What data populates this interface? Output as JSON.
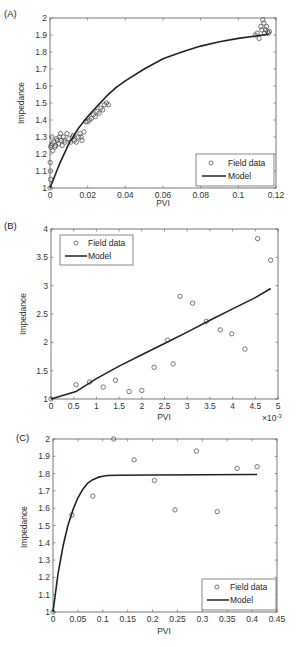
{
  "chart_data": [
    {
      "panel": "(A)",
      "type": "scatter",
      "title": "",
      "xlabel": "PVI",
      "ylabel": "Impedance",
      "xlim": [
        0,
        0.12
      ],
      "ylim": [
        1,
        2
      ],
      "xticks": [
        0,
        0.02,
        0.04,
        0.06,
        0.08,
        0.1,
        0.12
      ],
      "xtick_labels": [
        "0",
        "0.02",
        "0.04",
        "0.06",
        "0.08",
        "0.1",
        "0.12"
      ],
      "yticks": [
        1,
        1.1,
        1.2,
        1.3,
        1.4,
        1.5,
        1.6,
        1.7,
        1.8,
        1.9,
        2
      ],
      "ytick_labels": [
        "1",
        "1.1",
        "1.2",
        "1.3",
        "1.4",
        "1.5",
        "1.6",
        "1.7",
        "1.8",
        "1.9",
        "2"
      ],
      "grid": false,
      "legend_position": "lower right",
      "legend": [
        "Field data",
        "Model"
      ],
      "series": [
        {
          "name": "Field data",
          "style": "marker-circle",
          "points": [
            [
              0.0,
              1.0
            ],
            [
              0.0003,
              1.05
            ],
            [
              0.0002,
              1.1
            ],
            [
              0.0001,
              1.15
            ],
            [
              0.0004,
              1.24
            ],
            [
              0.0006,
              1.25
            ],
            [
              0.001,
              1.3
            ],
            [
              0.0012,
              1.26
            ],
            [
              0.0015,
              1.22
            ],
            [
              0.002,
              1.27
            ],
            [
              0.0025,
              1.24
            ],
            [
              0.003,
              1.25
            ],
            [
              0.0035,
              1.29
            ],
            [
              0.004,
              1.28
            ],
            [
              0.0045,
              1.26
            ],
            [
              0.005,
              1.3
            ],
            [
              0.0055,
              1.32
            ],
            [
              0.006,
              1.28
            ],
            [
              0.0065,
              1.25
            ],
            [
              0.007,
              1.3
            ],
            [
              0.0075,
              1.28
            ],
            [
              0.008,
              1.27
            ],
            [
              0.009,
              1.32
            ],
            [
              0.01,
              1.29
            ],
            [
              0.011,
              1.27
            ],
            [
              0.012,
              1.3
            ],
            [
              0.0125,
              1.31
            ],
            [
              0.013,
              1.28
            ],
            [
              0.014,
              1.27
            ],
            [
              0.015,
              1.3
            ],
            [
              0.016,
              1.32
            ],
            [
              0.0165,
              1.3
            ],
            [
              0.017,
              1.28
            ],
            [
              0.018,
              1.33
            ],
            [
              0.019,
              1.39
            ],
            [
              0.02,
              1.39
            ],
            [
              0.021,
              1.4
            ],
            [
              0.022,
              1.41
            ],
            [
              0.023,
              1.43
            ],
            [
              0.024,
              1.42
            ],
            [
              0.025,
              1.45
            ],
            [
              0.026,
              1.44
            ],
            [
              0.027,
              1.47
            ],
            [
              0.028,
              1.46
            ],
            [
              0.029,
              1.49
            ],
            [
              0.03,
              1.5
            ],
            [
              0.031,
              1.49
            ],
            [
              0.109,
              1.9
            ],
            [
              0.11,
              1.91
            ],
            [
              0.111,
              1.88
            ],
            [
              0.112,
              1.95
            ],
            [
              0.1125,
              1.93
            ],
            [
              0.113,
              1.99
            ],
            [
              0.1135,
              1.97
            ],
            [
              0.114,
              1.91
            ],
            [
              0.1145,
              1.93
            ],
            [
              0.115,
              1.95
            ],
            [
              0.1155,
              1.92
            ],
            [
              0.116,
              1.91
            ],
            [
              0.1165,
              1.92
            ]
          ]
        },
        {
          "name": "Model",
          "style": "line",
          "points": [
            [
              0,
              1.0
            ],
            [
              0.005,
              1.14
            ],
            [
              0.01,
              1.26
            ],
            [
              0.015,
              1.35
            ],
            [
              0.02,
              1.42
            ],
            [
              0.025,
              1.48
            ],
            [
              0.03,
              1.54
            ],
            [
              0.035,
              1.59
            ],
            [
              0.04,
              1.63
            ],
            [
              0.05,
              1.7
            ],
            [
              0.06,
              1.76
            ],
            [
              0.07,
              1.8
            ],
            [
              0.08,
              1.835
            ],
            [
              0.09,
              1.86
            ],
            [
              0.1,
              1.88
            ],
            [
              0.11,
              1.895
            ],
            [
              0.116,
              1.905
            ]
          ]
        }
      ]
    },
    {
      "panel": "(B)",
      "type": "scatter",
      "title": "",
      "xlabel": "PVI",
      "ylabel": "Impedance",
      "x_scale_note": "×10⁻³",
      "xlim": [
        0,
        5
      ],
      "ylim": [
        1,
        4
      ],
      "xticks": [
        0,
        0.5,
        1,
        1.5,
        2,
        2.5,
        3,
        3.5,
        4,
        4.5,
        5
      ],
      "xtick_labels": [
        "0",
        "0.5",
        "1",
        "1.5",
        "2",
        "2.5",
        "3",
        "3.5",
        "4",
        "4.5",
        "5"
      ],
      "yticks": [
        1,
        1.5,
        2,
        2.5,
        3,
        3.5,
        4
      ],
      "ytick_labels": [
        "1",
        "1.5",
        "2",
        "2.5",
        "3",
        "3.5",
        "4"
      ],
      "grid": false,
      "legend_position": "upper left",
      "legend": [
        "Field data",
        "Model"
      ],
      "series": [
        {
          "name": "Field data",
          "style": "marker-circle",
          "points": [
            [
              0.0,
              1.0
            ],
            [
              0.55,
              1.25
            ],
            [
              0.85,
              1.3
            ],
            [
              1.15,
              1.21
            ],
            [
              1.42,
              1.33
            ],
            [
              1.72,
              1.13
            ],
            [
              2.0,
              1.15
            ],
            [
              2.27,
              1.56
            ],
            [
              2.57,
              2.04
            ],
            [
              2.69,
              1.62
            ],
            [
              2.84,
              2.81
            ],
            [
              3.12,
              2.69
            ],
            [
              3.42,
              2.37
            ],
            [
              3.73,
              2.22
            ],
            [
              3.98,
              2.15
            ],
            [
              4.27,
              1.88
            ],
            [
              4.55,
              3.83
            ],
            [
              4.84,
              3.45
            ]
          ]
        },
        {
          "name": "Model",
          "style": "line",
          "points": [
            [
              0,
              1.0
            ],
            [
              0.55,
              1.13
            ],
            [
              1.0,
              1.36
            ],
            [
              1.5,
              1.58
            ],
            [
              2.0,
              1.78
            ],
            [
              2.5,
              1.98
            ],
            [
              3.0,
              2.18
            ],
            [
              3.5,
              2.39
            ],
            [
              4.0,
              2.59
            ],
            [
              4.5,
              2.79
            ],
            [
              4.84,
              2.95
            ]
          ]
        }
      ]
    },
    {
      "panel": "(C)",
      "type": "scatter",
      "title": "",
      "xlabel": "PVI",
      "ylabel": "Impedance",
      "xlim": [
        0,
        0.45
      ],
      "ylim": [
        1,
        2
      ],
      "xticks": [
        0,
        0.05,
        0.1,
        0.15,
        0.2,
        0.25,
        0.3,
        0.35,
        0.4,
        0.45
      ],
      "xtick_labels": [
        "0",
        "0.05",
        "0.1",
        "0.15",
        "0.2",
        "0.25",
        "0.3",
        "0.35",
        "0.4",
        "0.45"
      ],
      "yticks": [
        1,
        1.1,
        1.2,
        1.3,
        1.4,
        1.5,
        1.6,
        1.7,
        1.8,
        1.9,
        2
      ],
      "ytick_labels": [
        "1",
        "1.1",
        "1.2",
        "1.3",
        "1.4",
        "1.5",
        "1.6",
        "1.7",
        "1.8",
        "1.9",
        "2"
      ],
      "grid": false,
      "legend_position": "lower right",
      "legend": [
        "Field data",
        "Model"
      ],
      "series": [
        {
          "name": "Field data",
          "style": "marker-circle",
          "points": [
            [
              0.0,
              1.0
            ],
            [
              0.038,
              1.56
            ],
            [
              0.08,
              1.67
            ],
            [
              0.122,
              2.0
            ],
            [
              0.163,
              1.88
            ],
            [
              0.204,
              1.76
            ],
            [
              0.245,
              1.59
            ],
            [
              0.288,
              1.93
            ],
            [
              0.33,
              1.58
            ],
            [
              0.37,
              1.83
            ],
            [
              0.41,
              1.84
            ]
          ]
        },
        {
          "name": "Model",
          "style": "line",
          "points": [
            [
              0,
              1.0
            ],
            [
              0.01,
              1.22
            ],
            [
              0.02,
              1.38
            ],
            [
              0.03,
              1.5
            ],
            [
              0.04,
              1.59
            ],
            [
              0.05,
              1.66
            ],
            [
              0.06,
              1.71
            ],
            [
              0.07,
              1.745
            ],
            [
              0.08,
              1.765
            ],
            [
              0.09,
              1.778
            ],
            [
              0.1,
              1.785
            ],
            [
              0.11,
              1.789
            ],
            [
              0.13,
              1.791
            ],
            [
              0.2,
              1.792
            ],
            [
              0.3,
              1.793
            ],
            [
              0.41,
              1.795
            ]
          ]
        }
      ]
    }
  ],
  "panels": [
    {
      "label": "(A)",
      "xlabel": "PVI",
      "ylabel": "Impedance",
      "legend_field": "Field data",
      "legend_model": "Model"
    },
    {
      "label": "(B)",
      "xlabel": "PVI",
      "ylabel": "Impedance",
      "legend_field": "Field data",
      "legend_model": "Model",
      "x_exponent": "×10",
      "x_exponent_power": "-3"
    },
    {
      "label": "(C)",
      "xlabel": "PVI",
      "ylabel": "Impedance",
      "legend_field": "Field data",
      "legend_model": "Model"
    }
  ],
  "colors": {
    "axis": "#555555",
    "marker": "#555555",
    "model_line": "#222222",
    "text": "#333333",
    "background": "#ffffff"
  }
}
